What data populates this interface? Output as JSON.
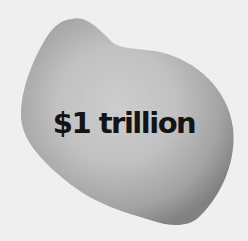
{
  "blob": {
    "label": "$1 trillion",
    "colors": {
      "background": "#efefef",
      "blob_center": "#c9c9c9",
      "blob_edge": "#858585",
      "text": "#141414"
    }
  }
}
